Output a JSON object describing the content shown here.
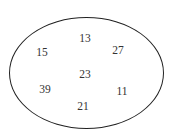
{
  "diagram": {
    "shape": "ellipse",
    "stroke_color": "#222222",
    "numbers": [
      {
        "value": "13",
        "x": 85,
        "y": 39
      },
      {
        "value": "15",
        "x": 42,
        "y": 53
      },
      {
        "value": "27",
        "x": 118,
        "y": 51
      },
      {
        "value": "23",
        "x": 85,
        "y": 75
      },
      {
        "value": "39",
        "x": 45,
        "y": 90
      },
      {
        "value": "11",
        "x": 122,
        "y": 92
      },
      {
        "value": "21",
        "x": 83,
        "y": 107
      }
    ]
  }
}
